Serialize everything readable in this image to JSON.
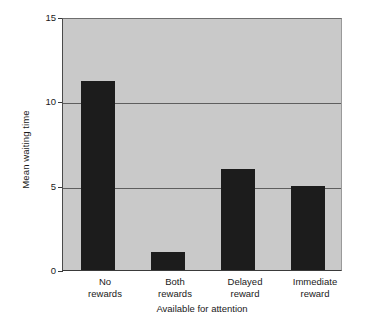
{
  "chart_data": {
    "type": "bar",
    "title": "",
    "subtitle": "",
    "xlabel": "Available for attention",
    "ylabel": "Mean waiting time",
    "categories": [
      "No rewards",
      "Both rewards",
      "Delayed reward",
      "Immediate reward"
    ],
    "category_lines": [
      [
        "No",
        "rewards"
      ],
      [
        "Both",
        "rewards"
      ],
      [
        "Delayed",
        "reward"
      ],
      [
        "Immediate",
        "reward"
      ]
    ],
    "values": [
      11.2,
      1.05,
      6.0,
      5.0
    ],
    "ylim": [
      0,
      15
    ],
    "yticks": [
      0,
      5,
      10,
      15
    ],
    "ytick_labels": [
      "0",
      "5",
      "10",
      "15"
    ],
    "grid": true,
    "gridlines_at": [
      5,
      10,
      15
    ],
    "legend": null,
    "legend_position": "none",
    "colors": {
      "bar": "#1c1c1c",
      "plot_background": "#c9c9c9",
      "figure_background": "#ffffff",
      "gridline": "#5e5e5e",
      "axis": "#3a3a3a",
      "text": "#1a1a1a"
    }
  }
}
